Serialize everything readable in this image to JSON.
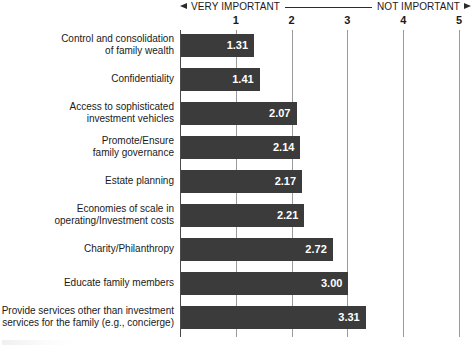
{
  "chart_data": {
    "type": "bar",
    "orientation": "horizontal",
    "title": "",
    "xlabel": "",
    "ylabel": "",
    "xlim": [
      0,
      5
    ],
    "grid": true,
    "legend": null,
    "axis_min_label": "VERY IMPORTANT",
    "axis_max_label": "NOT IMPORTANT",
    "tick_labels": [
      "1",
      "2",
      "3",
      "4",
      "5"
    ],
    "tick_values": [
      1,
      2,
      3,
      4,
      5
    ],
    "categories": [
      "Control and consolidation\nof family wealth",
      "Confidentiality",
      "Access to sophisticated\ninvestment vehicles",
      "Promote/Ensure\nfamily governance",
      "Estate planning",
      "Economies of scale in\noperating/Investment costs",
      "Charity/Philanthropy",
      "Educate family members",
      "Provide services other than investment\nservices for the family (e.g., concierge)"
    ],
    "values": [
      1.31,
      1.41,
      2.07,
      2.14,
      2.17,
      2.21,
      2.72,
      3.0,
      3.31
    ],
    "value_labels": [
      "1.31",
      "1.41",
      "2.07",
      "2.14",
      "2.17",
      "2.21",
      "2.72",
      "3.00",
      "3.31"
    ],
    "colors": {
      "bar": "#3b3b3b",
      "bar_label": "#ffffff",
      "gridline": "#9a9a9a",
      "axis": "#4a4a4a",
      "background": "#ffffff",
      "text": "#1a1a1a"
    }
  },
  "header": {
    "left_label": "VERY IMPORTANT",
    "right_label": "NOT IMPORTANT",
    "left_arrow_icon": "arrow-left-icon",
    "right_arrow_icon": "arrow-right-icon"
  }
}
